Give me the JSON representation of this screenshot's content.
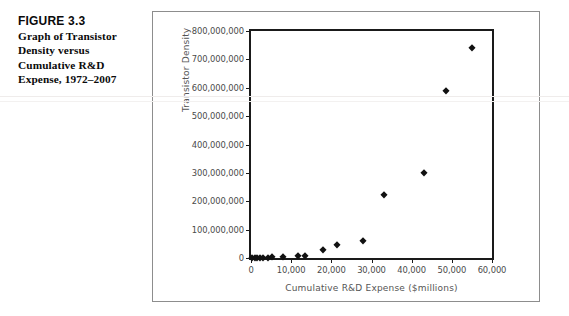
{
  "caption": {
    "figure_number": "FIGURE 3.3",
    "text": "Graph of Transistor Density versus Cumulative R&D Expense, 1972–2007"
  },
  "chart_data": {
    "type": "scatter",
    "title": "",
    "xlabel": "Cumulative R&D Expense ($millions)",
    "ylabel": "Transistor Density",
    "xlim": [
      0,
      60000
    ],
    "ylim": [
      0,
      800000000
    ],
    "xticks": [
      0,
      10000,
      20000,
      30000,
      40000,
      50000,
      60000
    ],
    "xtick_labels": [
      "0",
      "10,000",
      "20,000",
      "30,000",
      "40,000",
      "50,000",
      "60,000"
    ],
    "yticks": [
      0,
      100000000,
      200000000,
      300000000,
      400000000,
      500000000,
      600000000,
      700000000,
      800000000
    ],
    "ytick_labels": [
      "0",
      "100,000,000",
      "200,000,000",
      "300,000,000",
      "400,000,000",
      "500,000,000",
      "600,000,000",
      "700,000,000",
      "800,000,000"
    ],
    "grid": false,
    "legend": false,
    "marker": "diamond",
    "marker_color": "#111111",
    "points": [
      {
        "x": 300,
        "y": 2000
      },
      {
        "x": 900,
        "y": 5000
      },
      {
        "x": 1500,
        "y": 29000
      },
      {
        "x": 2300,
        "y": 120000
      },
      {
        "x": 3000,
        "y": 275000
      },
      {
        "x": 4200,
        "y": 1200000
      },
      {
        "x": 5200,
        "y": 3100000
      },
      {
        "x": 8000,
        "y": 3100000
      },
      {
        "x": 11800,
        "y": 5500000
      },
      {
        "x": 13500,
        "y": 7500000
      },
      {
        "x": 18000,
        "y": 28000000
      },
      {
        "x": 21500,
        "y": 45000000
      },
      {
        "x": 28000,
        "y": 60000000
      },
      {
        "x": 33000,
        "y": 222000000
      },
      {
        "x": 43000,
        "y": 300000000
      },
      {
        "x": 48500,
        "y": 588000000
      },
      {
        "x": 55000,
        "y": 740000000
      }
    ]
  }
}
